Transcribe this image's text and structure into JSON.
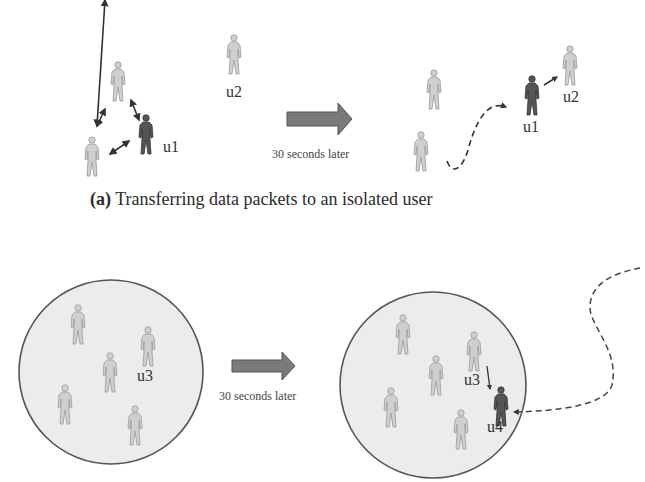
{
  "panel_a": {
    "caption_tag": "(a)",
    "caption_text": "Transferring data packets to an isolated user",
    "transition_label": "30 seconds later",
    "before": {
      "labels": {
        "u1": "u1",
        "u2": "u2"
      }
    },
    "after": {
      "labels": {
        "u1": "u1",
        "u2": "u2"
      }
    }
  },
  "panel_b": {
    "transition_label": "30 seconds later",
    "before": {
      "labels": {
        "u3": "u3"
      }
    },
    "after": {
      "labels": {
        "u3": "u3",
        "u4": "u4"
      }
    }
  },
  "colors": {
    "user_light": "#c8c8c8",
    "user_dark": "#4a4a4a",
    "arrow_fill": "#6e6e6e",
    "circle_fill": "#ececec",
    "circle_stroke": "#555555",
    "line": "#444444"
  }
}
